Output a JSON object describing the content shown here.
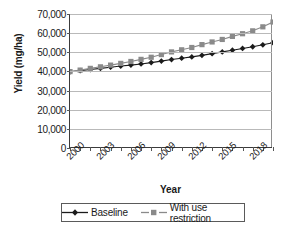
{
  "chart_data": {
    "type": "line",
    "title": "",
    "xlabel": "Year",
    "ylabel": "Yield (mg/ha)",
    "x": [
      2000,
      2001,
      2002,
      2003,
      2004,
      2005,
      2006,
      2007,
      2008,
      2009,
      2010,
      2011,
      2012,
      2013,
      2014,
      2015,
      2016,
      2017,
      2018,
      2019,
      2020
    ],
    "xtick_labels": [
      "2000",
      "2003",
      "2006",
      "2009",
      "2012",
      "2015",
      "2018"
    ],
    "xtick_label_years": [
      2000,
      2003,
      2006,
      2009,
      2012,
      2015,
      2018
    ],
    "ytick_labels": [
      "0",
      "10,000",
      "20,000",
      "30,000",
      "40,000",
      "50,000",
      "60,000",
      "70,000"
    ],
    "ytick_values": [
      0,
      10000,
      20000,
      30000,
      40000,
      50000,
      60000,
      70000
    ],
    "ylim": [
      0,
      70000
    ],
    "xlim": [
      2000,
      2020
    ],
    "grid": "horizontal",
    "legend_position": "bottom",
    "series": [
      {
        "name": "Baseline",
        "marker": "diamond",
        "color": "#1b1b1b",
        "values": [
          39800,
          40400,
          41000,
          41600,
          42200,
          42800,
          43300,
          43900,
          44600,
          45400,
          46200,
          46900,
          47600,
          48400,
          49300,
          50200,
          51100,
          52000,
          52900,
          53900,
          55000
        ]
      },
      {
        "name": "With use restriction",
        "marker": "square",
        "color": "#8a8a8a",
        "values": [
          39900,
          40700,
          41600,
          42400,
          43300,
          44200,
          45200,
          46300,
          47400,
          48800,
          50200,
          51300,
          52500,
          54000,
          55400,
          56700,
          58300,
          59700,
          61200,
          63300,
          65800
        ]
      }
    ]
  },
  "legend": {
    "items": [
      {
        "label": "Baseline"
      },
      {
        "label": "With use restriction"
      }
    ]
  },
  "axes": {
    "x_title": "Year",
    "y_title": "Yield (mg/ha)"
  },
  "colors": {
    "baseline": "#1b1b1b",
    "restriction": "#8a8a8a",
    "grid": "#b9b9b9",
    "axis": "#3b3b3b",
    "frame": "#8e8e8e",
    "text": "#1a1a1a",
    "background": "#ffffff"
  }
}
